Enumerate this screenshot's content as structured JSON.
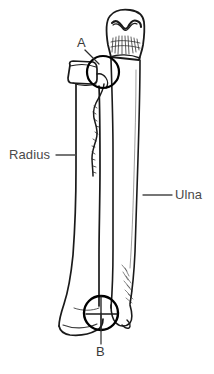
{
  "figure": {
    "kind": "anatomical-line-drawing",
    "background_color": "#ffffff",
    "ink_color": "#1a1a1a",
    "label_color": "#4a4a4a",
    "width": 214,
    "height": 374
  },
  "labels": {
    "radius": {
      "text": "Radius",
      "x": 9,
      "y": 148,
      "leader": {
        "x1": 56,
        "y1": 155,
        "x2": 76,
        "y2": 155
      }
    },
    "ulna": {
      "text": "Ulna",
      "x": 175,
      "y": 188,
      "leader": {
        "x1": 143,
        "y1": 195,
        "x2": 172,
        "y2": 195
      }
    }
  },
  "markers": {
    "a": {
      "text": "A",
      "x": 77,
      "y": 36,
      "circle": {
        "cx": 103,
        "cy": 72,
        "r": 16
      },
      "leader": {
        "x1": 85,
        "y1": 50,
        "x2": 99,
        "y2": 64
      }
    },
    "b": {
      "text": "B",
      "x": 96,
      "y": 345,
      "circle": {
        "cx": 101,
        "cy": 313,
        "r": 17
      },
      "leader": {
        "x1": 101,
        "y1": 313,
        "x2": 101,
        "y2": 344
      }
    }
  },
  "bones": {
    "radius": {
      "name": "Radius",
      "side": "left",
      "head_box": {
        "x": 69,
        "y": 61,
        "w": 26,
        "h": 22
      },
      "shaft_left_x": 76,
      "shaft_right_x": 100,
      "distal_flare_y": 300
    },
    "ulna": {
      "name": "Ulna",
      "side": "right",
      "olecranon_box": {
        "x": 104,
        "y": 12,
        "w": 40,
        "h": 48
      },
      "shaft_left_x": 112,
      "shaft_right_x": 136,
      "distal_head_y": 305
    }
  }
}
